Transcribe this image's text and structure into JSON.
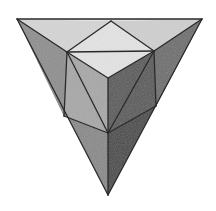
{
  "image": {
    "subject": "pencil drawing of a truncated tetrahedron-like polyhedron with a cube corner on top",
    "width": 216,
    "height": 211,
    "background": "#ffffff",
    "stroke_color": "#2a2a2a"
  },
  "vertices": {
    "A": [
      17,
      19
    ],
    "B": [
      202,
      19
    ],
    "C": [
      111,
      21
    ],
    "D": [
      67,
      52
    ],
    "E": [
      154,
      51
    ],
    "F": [
      108,
      78
    ],
    "G": [
      64,
      116
    ],
    "H": [
      156,
      106
    ],
    "I": [
      108,
      133
    ],
    "J": [
      108,
      195
    ]
  },
  "faces": [
    {
      "name": "top-left-triangle",
      "points": "17,19 111,21 67,52",
      "fill": "#d6d6d6"
    },
    {
      "name": "top-right-triangle",
      "points": "111,21 202,19 154,51",
      "fill": "#d0d0d0"
    },
    {
      "name": "top-cube-face",
      "points": "111,21 154,51 108,78 67,52",
      "fill": "#e4e4e4"
    },
    {
      "name": "top-strip",
      "points": "17,19 202,19 111,21",
      "fill": "#e0e0e0"
    },
    {
      "name": "left-outer-face",
      "points": "17,19 67,52 64,116",
      "fill": "#8f8f8f"
    },
    {
      "name": "left-cube-face",
      "points": "67,52 108,78 108,133 64,116",
      "fill": "#a8a8a8"
    },
    {
      "name": "right-cube-face",
      "points": "108,78 154,51 156,106 108,133",
      "fill": "#5a5a5a"
    },
    {
      "name": "right-outer-face",
      "points": "154,51 202,19 156,106",
      "fill": "#6e6e6e"
    },
    {
      "name": "lower-left-face",
      "points": "17,19 64,116 108,133 108,195",
      "fill": "#8a8a8a"
    },
    {
      "name": "lower-right-face",
      "points": "202,19 156,106 108,133 108,195",
      "fill": "#4a4a4a"
    }
  ],
  "edges": [
    [
      17,
      19,
      202,
      19
    ],
    [
      17,
      19,
      108,
      195
    ],
    [
      202,
      19,
      108,
      195
    ],
    [
      17,
      19,
      67,
      52
    ],
    [
      111,
      21,
      67,
      52
    ],
    [
      111,
      21,
      154,
      51
    ],
    [
      202,
      19,
      154,
      51
    ],
    [
      67,
      52,
      154,
      51
    ],
    [
      67,
      52,
      108,
      78
    ],
    [
      154,
      51,
      108,
      78
    ],
    [
      67,
      52,
      64,
      116
    ],
    [
      67,
      52,
      108,
      133
    ],
    [
      108,
      78,
      108,
      133
    ],
    [
      154,
      51,
      156,
      106
    ],
    [
      154,
      51,
      108,
      133
    ],
    [
      64,
      116,
      108,
      133
    ],
    [
      156,
      106,
      108,
      133
    ],
    [
      108,
      133,
      108,
      195
    ]
  ]
}
